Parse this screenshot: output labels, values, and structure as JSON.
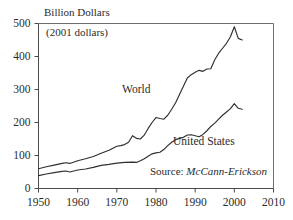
{
  "chart_data": {
    "type": "line",
    "title": "Billion Dollars",
    "subtitle": "(2001 dollars)",
    "xlabel": "",
    "ylabel": "Billion Dollars",
    "xlim": [
      1950,
      2010
    ],
    "ylim": [
      0,
      500
    ],
    "xticks": [
      1950,
      1960,
      1970,
      1980,
      1990,
      2000,
      2010
    ],
    "yticks": [
      0,
      100,
      200,
      300,
      400,
      500
    ],
    "grid": false,
    "legend_position": "inline-annotation",
    "source": "Source: ",
    "source_name": "McCann-Erickson",
    "series": [
      {
        "name": "World",
        "label_x": 1979,
        "label_y": 300,
        "x": [
          1950,
          1952,
          1954,
          1956,
          1957,
          1958,
          1960,
          1962,
          1964,
          1966,
          1968,
          1969,
          1970,
          1971,
          1972,
          1973,
          1974,
          1975,
          1976,
          1977,
          1978,
          1979,
          1980,
          1981,
          1982,
          1983,
          1984,
          1985,
          1986,
          1987,
          1988,
          1989,
          1990,
          1991,
          1992,
          1993,
          1994,
          1995,
          1996,
          1997,
          1998,
          1999,
          2000,
          2001,
          2002
        ],
        "values": [
          60,
          66,
          71,
          76,
          78,
          76,
          84,
          90,
          97,
          107,
          116,
          122,
          128,
          130,
          133,
          140,
          160,
          152,
          150,
          162,
          182,
          200,
          215,
          212,
          210,
          222,
          240,
          260,
          285,
          310,
          335,
          345,
          352,
          358,
          355,
          362,
          363,
          390,
          410,
          425,
          440,
          460,
          490,
          455,
          450
        ]
      },
      {
        "name": "United States",
        "label_x": 1992,
        "label_y": 140,
        "x": [
          1950,
          1952,
          1954,
          1956,
          1957,
          1958,
          1960,
          1962,
          1964,
          1966,
          1968,
          1970,
          1972,
          1974,
          1975,
          1976,
          1977,
          1978,
          1979,
          1980,
          1981,
          1982,
          1983,
          1984,
          1985,
          1986,
          1987,
          1988,
          1989,
          1990,
          1991,
          1992,
          1993,
          1994,
          1995,
          1996,
          1997,
          1998,
          1999,
          2000,
          2001,
          2002
        ],
        "values": [
          39,
          44,
          48,
          52,
          53,
          50,
          56,
          59,
          64,
          70,
          73,
          77,
          79,
          80,
          79,
          84,
          90,
          98,
          105,
          108,
          110,
          118,
          130,
          140,
          148,
          152,
          155,
          162,
          163,
          160,
          157,
          164,
          175,
          188,
          198,
          210,
          222,
          232,
          242,
          257,
          243,
          240
        ]
      }
    ]
  }
}
